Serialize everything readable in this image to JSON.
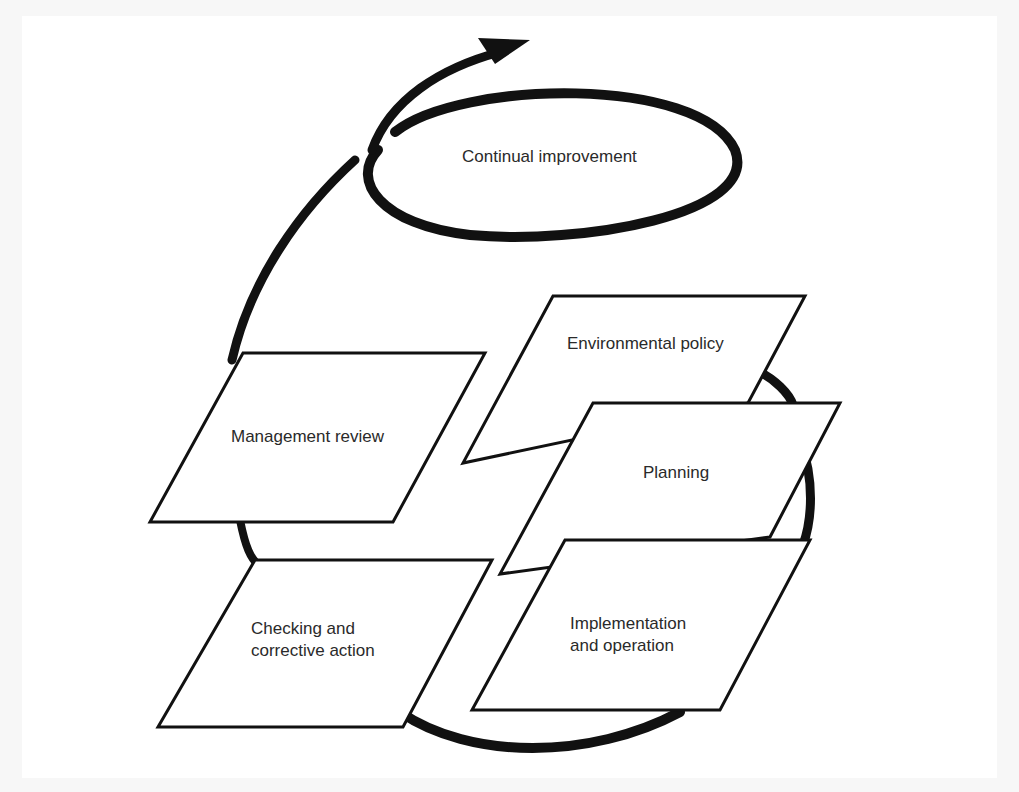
{
  "diagram": {
    "title": "Continual improvement",
    "steps": [
      {
        "label": "Environmental policy"
      },
      {
        "label": "Planning"
      },
      {
        "label": "Implementation\nand operation",
        "line1": "Implementation",
        "line2": "and operation"
      },
      {
        "label": "Checking and\ncorrective action",
        "line1": "Checking and",
        "line2": "corrective action"
      },
      {
        "label": "Management review"
      }
    ],
    "colors": {
      "stroke": "#111111",
      "text": "#2a2a2a",
      "fill": "#ffffff",
      "page": "#ffffff"
    }
  }
}
